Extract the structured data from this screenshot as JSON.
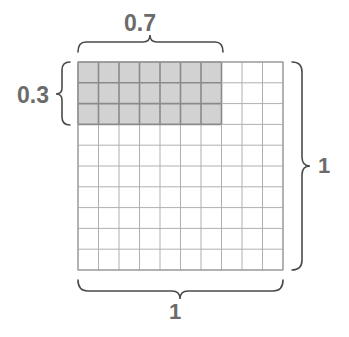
{
  "figure": {
    "title": "",
    "type": "unit-square-area-model",
    "grid": {
      "columns": 10,
      "rows": 10,
      "shaded_columns": 7,
      "shaded_rows": 3,
      "shaded_cell_count": 21,
      "cell_fill_shaded": "#d2d2d2",
      "cell_fill_unshaded": "#ffffff",
      "gridline_color_shaded": "#8a8a8a",
      "gridline_color_unshaded": "#b0b0b0",
      "border_color": "#9a9a9a"
    },
    "labels": {
      "top": "0.7",
      "left": "0.3",
      "right": "1",
      "bottom": "1"
    },
    "label_color": "#6b6b6b",
    "brace_color": "#4a4a4a"
  },
  "chart_data": {
    "type": "heatmap",
    "title": "",
    "xlabel": "",
    "ylabel": "",
    "categories": [
      "c1",
      "c2",
      "c3",
      "c4",
      "c5",
      "c6",
      "c7",
      "c8",
      "c9",
      "c10"
    ],
    "rows": [
      "r1",
      "r2",
      "r3",
      "r4",
      "r5",
      "r6",
      "r7",
      "r8",
      "r9",
      "r10"
    ],
    "values": [
      [
        1,
        1,
        1,
        1,
        1,
        1,
        1,
        0,
        0,
        0
      ],
      [
        1,
        1,
        1,
        1,
        1,
        1,
        1,
        0,
        0,
        0
      ],
      [
        1,
        1,
        1,
        1,
        1,
        1,
        1,
        0,
        0,
        0
      ],
      [
        0,
        0,
        0,
        0,
        0,
        0,
        0,
        0,
        0,
        0
      ],
      [
        0,
        0,
        0,
        0,
        0,
        0,
        0,
        0,
        0,
        0
      ],
      [
        0,
        0,
        0,
        0,
        0,
        0,
        0,
        0,
        0,
        0
      ],
      [
        0,
        0,
        0,
        0,
        0,
        0,
        0,
        0,
        0,
        0
      ],
      [
        0,
        0,
        0,
        0,
        0,
        0,
        0,
        0,
        0,
        0
      ],
      [
        0,
        0,
        0,
        0,
        0,
        0,
        0,
        0,
        0,
        0
      ],
      [
        0,
        0,
        0,
        0,
        0,
        0,
        0,
        0,
        0,
        0
      ]
    ],
    "annotations": [
      {
        "text": "0.7",
        "position": "top",
        "spans": "columns 1-7"
      },
      {
        "text": "0.3",
        "position": "left",
        "spans": "rows 1-3"
      },
      {
        "text": "1",
        "position": "right",
        "spans": "all 10 rows"
      },
      {
        "text": "1",
        "position": "bottom",
        "spans": "all 10 columns"
      }
    ],
    "grid": true,
    "legend": "none"
  }
}
